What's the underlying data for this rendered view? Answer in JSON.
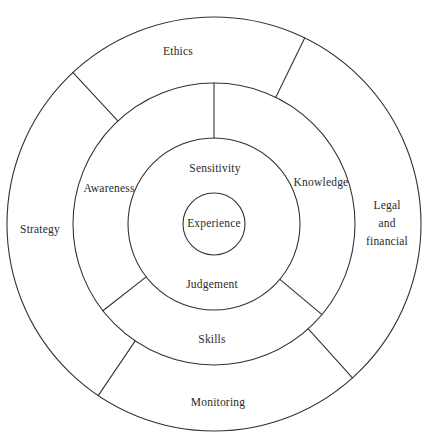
{
  "diagram": {
    "type": "concentric-ring-wheel",
    "background_color": "#ffffff",
    "stroke_color": "#333333",
    "text_color": "#2a2a2a",
    "center": {
      "x": 214,
      "y": 224
    },
    "rings": [
      {
        "name": "outer-ring",
        "inner_radius": 141,
        "outer_radius": 207,
        "segments": [
          {
            "id": "ethics",
            "label": "Ethics",
            "label_x": 178,
            "label_y": 52
          },
          {
            "id": "legal-and-financial",
            "label": "Legal and financial",
            "lines": [
              "Legal",
              "and",
              "financial"
            ],
            "label_x": 387,
            "label_y": 224
          },
          {
            "id": "monitoring",
            "label": "Monitoring",
            "label_x": 218,
            "label_y": 403
          },
          {
            "id": "strategy",
            "label": "Strategy",
            "label_x": 40,
            "label_y": 230
          }
        ]
      },
      {
        "name": "middle-ring",
        "inner_radius": 86,
        "outer_radius": 141,
        "segments": [
          {
            "id": "awareness",
            "label": "Awareness",
            "label_x": 109,
            "label_y": 189
          },
          {
            "id": "knowledge",
            "label": "Knowledge",
            "label_x": 321,
            "label_y": 183
          },
          {
            "id": "skills",
            "label": "Skills",
            "label_x": 212,
            "label_y": 340
          }
        ]
      },
      {
        "name": "inner-ring",
        "inner_radius": 31,
        "outer_radius": 86,
        "segments": [
          {
            "id": "sensitivity",
            "label": "Sensitivity",
            "label_x": 215,
            "label_y": 169
          },
          {
            "id": "judgement",
            "label": "Judgement",
            "label_x": 212,
            "label_y": 285
          }
        ]
      },
      {
        "name": "core-circle",
        "inner_radius": 0,
        "outer_radius": 31,
        "segments": [
          {
            "id": "experience",
            "label": "Experience",
            "label_x": 214,
            "label_y": 224
          }
        ]
      }
    ],
    "dividers": [
      {
        "id": "divider-outer-ethics-legal",
        "from_radius": 141,
        "to_radius": 207,
        "angle_deg": -64
      },
      {
        "id": "divider-outer-legal-monitoring",
        "from_radius": 141,
        "to_radius": 207,
        "angle_deg": 48
      },
      {
        "id": "divider-outer-monitoring-strategy",
        "from_radius": 141,
        "to_radius": 207,
        "angle_deg": 124
      },
      {
        "id": "divider-outer-strategy-ethics",
        "from_radius": 141,
        "to_radius": 207,
        "angle_deg": -133
      },
      {
        "id": "divider-middle-awareness-knowledge-top",
        "from_radius": 86,
        "to_radius": 141,
        "angle_deg": -90
      },
      {
        "id": "divider-middle-knowledge-skills",
        "from_radius": 86,
        "to_radius": 141,
        "angle_deg": 40
      },
      {
        "id": "divider-middle-skills-awareness",
        "from_radius": 86,
        "to_radius": 141,
        "angle_deg": 142
      }
    ]
  }
}
